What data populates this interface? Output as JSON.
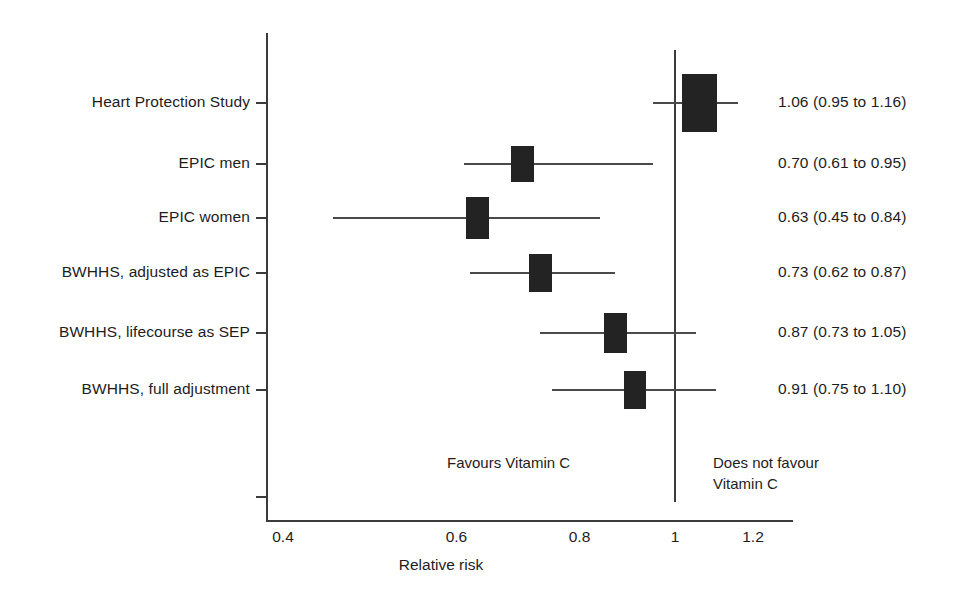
{
  "chart_data": {
    "type": "forest",
    "title": "",
    "xlabel": "Relative risk",
    "ylabel": "",
    "scale": "log",
    "xlim": [
      0.4,
      1.26
    ],
    "xticks": [
      0.4,
      0.6,
      0.8,
      1.0,
      1.2
    ],
    "xtick_labels": [
      "0.4",
      "0.6",
      "0.8",
      "1",
      "1.2"
    ],
    "null_value": 1.0,
    "grid": false,
    "legend": "none",
    "annotations": {
      "left": "Favours Vitamin C",
      "right": "Does not favour\nVitamin C"
    },
    "categories": [
      "Heart Protection Study",
      "EPIC men",
      "EPIC women",
      "BWHHS, adjusted as EPIC",
      "BWHHS, lifecourse as SEP",
      "BWHHS, full adjustment"
    ],
    "series": [
      {
        "name": "Relative risk",
        "points": [
          {
            "label": "Heart Protection Study",
            "estimate": 1.06,
            "ci_low": 0.95,
            "ci_high": 1.16,
            "text": "1.06 (0.95 to 1.16)"
          },
          {
            "label": "EPIC men",
            "estimate": 0.7,
            "ci_low": 0.61,
            "ci_high": 0.95,
            "text": "0.70 (0.61 to 0.95)"
          },
          {
            "label": "EPIC women",
            "estimate": 0.63,
            "ci_low": 0.45,
            "ci_high": 0.84,
            "text": "0.63 (0.45 to 0.84)"
          },
          {
            "label": "BWHHS, adjusted as EPIC",
            "estimate": 0.73,
            "ci_low": 0.62,
            "ci_high": 0.87,
            "text": "0.73 (0.62 to 0.87)"
          },
          {
            "label": "BWHHS, lifecourse as SEP",
            "estimate": 0.87,
            "ci_low": 0.73,
            "ci_high": 1.05,
            "text": "0.87 (0.73 to 1.05)"
          },
          {
            "label": "BWHHS, full adjustment",
            "estimate": 0.91,
            "ci_low": 0.75,
            "ci_high": 1.1,
            "text": "0.91 (0.75 to 1.10)"
          }
        ]
      }
    ]
  },
  "rows": [
    {
      "label": "Heart Protection Study",
      "value": "1.06 (0.95 to 1.16)"
    },
    {
      "label": "EPIC men",
      "value": "0.70 (0.61 to 0.95)"
    },
    {
      "label": "EPIC women",
      "value": "0.63 (0.45 to 0.84)"
    },
    {
      "label": "BWHHS, adjusted as EPIC",
      "value": "0.73 (0.62 to 0.87)"
    },
    {
      "label": "BWHHS, lifecourse as SEP",
      "value": "0.87 (0.73 to 1.05)"
    },
    {
      "label": "BWHHS, full adjustment",
      "value": "0.91 (0.75 to 1.10)"
    }
  ],
  "axis": {
    "x_title": "Relative risk",
    "tick_labels": [
      "0.4",
      "0.6",
      "0.8",
      "1",
      "1.2"
    ]
  },
  "notes": {
    "favours": "Favours Vitamin C",
    "not_favours": "Does not favour\nVitamin C"
  },
  "colors": {
    "marker": "#232323",
    "axis": "#3b3b3b",
    "whisker": "#4a4a4a",
    "text": "#1d1d1d",
    "background": "#ffffff"
  }
}
